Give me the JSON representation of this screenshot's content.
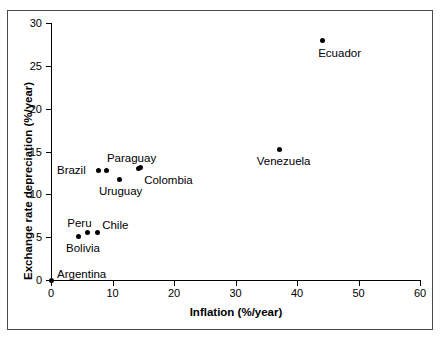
{
  "chart_data": {
    "type": "scatter",
    "title": "",
    "xlabel": "Inflation (%/year)",
    "ylabel": "Exchange rate depreciation (%/year)",
    "xlim": [
      0,
      60
    ],
    "ylim": [
      0,
      30
    ],
    "xticks": [
      0,
      10,
      20,
      30,
      40,
      50,
      60
    ],
    "yticks": [
      0,
      5,
      10,
      15,
      20,
      25,
      30
    ],
    "grid": false,
    "legend": "none",
    "points": [
      {
        "label": "Argentina",
        "x": 0.0,
        "y": 0.0,
        "label_dx": 6,
        "label_dy": -12
      },
      {
        "label": "Bolivia",
        "x": 4.4,
        "y": 5.1,
        "label_dx": -12,
        "label_dy": 6
      },
      {
        "label": "Peru",
        "x": 5.9,
        "y": 5.5,
        "label_dx": -20,
        "label_dy": -16
      },
      {
        "label": "Chile",
        "x": 7.5,
        "y": 5.6,
        "label_dx": 5,
        "label_dy": -13
      },
      {
        "label": "Brazil",
        "x": 7.8,
        "y": 12.8,
        "label_dx": -42,
        "label_dy": -6
      },
      {
        "label": "",
        "x": 9.1,
        "y": 12.8,
        "label_dx": 0,
        "label_dy": 0
      },
      {
        "label": "Uruguay",
        "x": 11.2,
        "y": 11.7,
        "label_dx": -21,
        "label_dy": 5
      },
      {
        "label": "Paraguay",
        "x": 14.3,
        "y": 13.0,
        "label_dx": -32,
        "label_dy": -17
      },
      {
        "label": "Colombia",
        "x": 14.5,
        "y": 13.1,
        "label_dx": 4,
        "label_dy": 6
      },
      {
        "label": "Venezuela",
        "x": 37.2,
        "y": 15.2,
        "label_dx": -23,
        "label_dy": 5
      },
      {
        "label": "Ecuador",
        "x": 44.1,
        "y": 27.9,
        "label_dx": -4,
        "label_dy": 6
      }
    ]
  }
}
